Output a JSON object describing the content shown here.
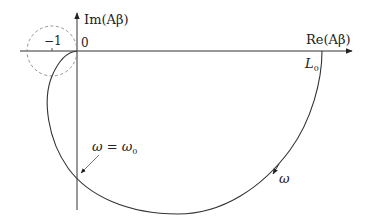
{
  "diagram": {
    "type": "nyquist-plot",
    "axes": {
      "x_label": "Re(Aβ)",
      "y_label": "Im(Aβ)",
      "origin_label": "0",
      "minus_one_label": "−1"
    },
    "annotations": {
      "start_point_label": "L",
      "start_point_subscript": "0",
      "crossing_label_left": "ω = ω",
      "crossing_label_subscript": "0",
      "direction_label": "ω"
    },
    "colors": {
      "axis": "#222222",
      "curve": "#333333",
      "circle": "#888888"
    }
  }
}
